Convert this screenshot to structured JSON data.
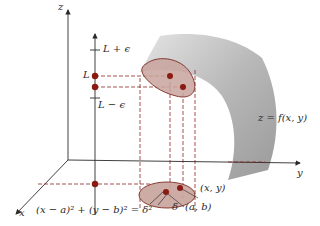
{
  "figure": {
    "axes": {
      "x_label": "x",
      "y_label": "y",
      "z_label": "z"
    },
    "z_ticks": {
      "upper": "L + ϵ",
      "center": "L",
      "lower": "L − ϵ"
    },
    "surface_label": "z = f(x, y)",
    "disk_labels": {
      "point": "(x, y)",
      "center": "(a, b)",
      "radius": "δ"
    },
    "equation": "(x − a)² + (y − b)² = δ²",
    "colors": {
      "surface": "#a9a9a9",
      "surface_light": "#d6d6d6",
      "disk_fill": "#c9a39c",
      "disk_stroke": "#7a2a22",
      "point": "#8b1a10",
      "dashed": "#8b2a22",
      "axis": "#2a2a2a"
    }
  }
}
